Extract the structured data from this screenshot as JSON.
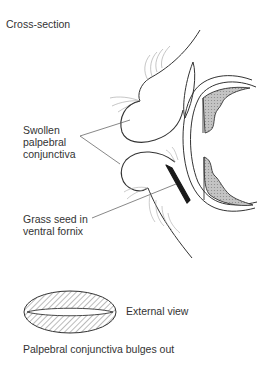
{
  "diagram": {
    "title": "Cross-section",
    "labels": {
      "swollen": "Swollen\npalpebral\nconjunctiva",
      "grass_seed": "Grass seed in\nventral fornix",
      "external_view": "External view",
      "caption": "Palpebral conjunctiva bulges out"
    },
    "colors": {
      "line": "#333333",
      "hair": "#9a9a9a",
      "shading": "#b8b8b8",
      "seed": "#1a1a1a",
      "background": "#ffffff"
    },
    "parts": [
      {
        "name": "upper-eyelid",
        "role": "swollen palpebral conjunctiva (upper)"
      },
      {
        "name": "lower-eyelid",
        "role": "swollen palpebral conjunctiva (lower)"
      },
      {
        "name": "third-eyelid",
        "role": "nictitating membrane"
      },
      {
        "name": "cornea-sclera",
        "role": "globe outline"
      },
      {
        "name": "iris-ciliary-body",
        "role": "shaded structures"
      },
      {
        "name": "grass-seed",
        "role": "foreign body in ventral fornix"
      },
      {
        "name": "external-view-ellipse",
        "role": "hatched bulging conjunctiva"
      }
    ]
  }
}
